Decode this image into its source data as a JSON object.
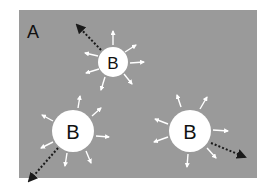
{
  "diagram": {
    "panel_label": "A",
    "panel_color": "#9a9a9a",
    "particle_color": "#ffffff",
    "arrow_color": "#1a1a1a",
    "particles": [
      {
        "label": "B",
        "cx": 113,
        "cy": 62,
        "r": 15
      },
      {
        "label": "B",
        "cx": 73,
        "cy": 131,
        "r": 21
      },
      {
        "label": "B",
        "cx": 190,
        "cy": 131,
        "r": 21
      }
    ]
  }
}
